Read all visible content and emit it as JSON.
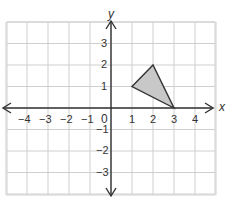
{
  "diagram": {
    "type": "coordinate-plane",
    "x_axis_label": "x",
    "y_axis_label": "y",
    "origin_label": "0",
    "x_ticks": [
      "−4",
      "−3",
      "−2",
      "−1",
      "1",
      "2",
      "3",
      "4"
    ],
    "y_ticks": [
      "3",
      "2",
      "1",
      "−1",
      "−2",
      "−3"
    ],
    "x_range": [
      -5,
      5
    ],
    "y_range": [
      -4,
      4
    ],
    "shape": {
      "type": "triangle",
      "vertices": [
        [
          1,
          1
        ],
        [
          2,
          2
        ],
        [
          3,
          0
        ]
      ],
      "fill": "#c8c8c8",
      "stroke": "#333333"
    },
    "grid_color": "#cfcfcf",
    "axis_color": "#333333"
  }
}
